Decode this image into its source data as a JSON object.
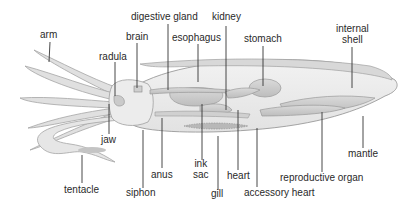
{
  "diagram": {
    "colors": {
      "body_fill": "#e9e9e9",
      "organ_fill": "#cfcfcf",
      "outline": "#9a9a9a",
      "label_text": "#2a2a2a",
      "leader_line": "#333333"
    },
    "labels": {
      "arm": "arm",
      "radula": "radula",
      "brain": "brain",
      "digestive_gland": "digestive gland",
      "esophagus": "esophagus",
      "kidney": "kidney",
      "stomach": "stomach",
      "internal_shell_1": "internal",
      "internal_shell_2": "shell",
      "jaw": "jaw",
      "tentacle": "tentacle",
      "siphon": "siphon",
      "anus": "anus",
      "ink_sac_1": "ink",
      "ink_sac_2": "sac",
      "gill": "gill",
      "heart": "heart",
      "accessory_heart": "accessory heart",
      "reproductive_organ": "reproductive organ",
      "mantle": "mantle"
    }
  }
}
